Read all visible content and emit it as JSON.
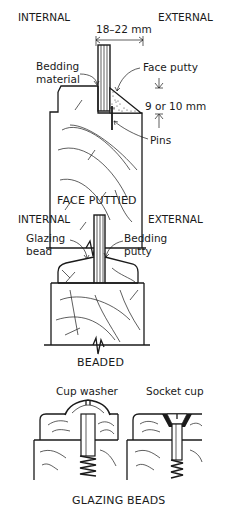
{
  "figure_1": {
    "label_internal": "INTERNAL",
    "label_external": "EXTERNAL",
    "dimension_width": "18–22 mm",
    "label_bedding": "Bedding\nmaterial",
    "label_bedding_line1": "Bedding",
    "label_bedding_line2": "material",
    "label_face_putty": "Face putty",
    "dimension_height": "9 or 10 mm",
    "label_pins": "Pins",
    "caption": "FACE PUTTIED"
  },
  "figure_2": {
    "label_internal": "INTERNAL",
    "label_external": "EXTERNAL",
    "label_glazing_line1": "Glazing",
    "label_glazing_line2": "bead",
    "label_bedding_line1": "Bedding",
    "label_bedding_line2": "putty",
    "caption": "BEADED"
  },
  "figure_3": {
    "label_cup_washer": "Cup washer",
    "label_socket_cup": "Socket cup",
    "caption": "GLAZING BEADS"
  }
}
